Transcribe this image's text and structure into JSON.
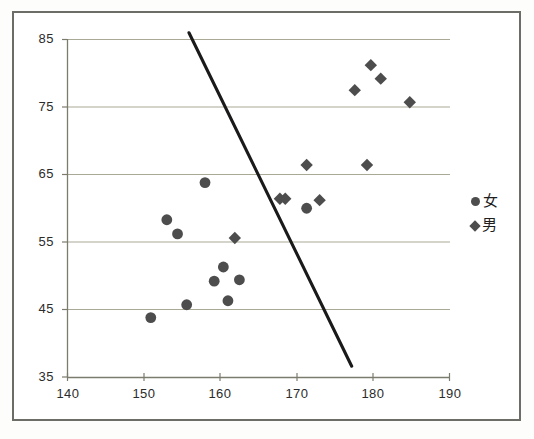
{
  "chart_data": {
    "type": "scatter",
    "title": "",
    "xlabel": "",
    "ylabel": "",
    "xlim": [
      140,
      190
    ],
    "ylim": [
      35,
      85
    ],
    "xticks": [
      140,
      150,
      160,
      170,
      180,
      190
    ],
    "yticks": [
      35,
      45,
      55,
      65,
      75,
      85
    ],
    "grid": "horizontal",
    "legend_position": "right",
    "marker_color": "#4d4d4d",
    "gridline_color": "#a9a995",
    "axis_color": "#8a8a7a",
    "trendline_color": "#1a1a1a",
    "series": [
      {
        "name": "女",
        "marker": "circle",
        "points": [
          [
            150.9,
            43.8
          ],
          [
            153.0,
            58.3
          ],
          [
            154.4,
            56.2
          ],
          [
            155.6,
            45.7
          ],
          [
            158.0,
            63.8
          ],
          [
            159.2,
            49.2
          ],
          [
            160.4,
            51.3
          ],
          [
            161.0,
            46.3
          ],
          [
            162.5,
            49.4
          ],
          [
            171.3,
            60.0
          ]
        ]
      },
      {
        "name": "男",
        "marker": "diamond",
        "points": [
          [
            161.9,
            55.6
          ],
          [
            167.8,
            61.4
          ],
          [
            168.5,
            61.4
          ],
          [
            171.3,
            66.4
          ],
          [
            173.0,
            61.2
          ],
          [
            177.6,
            77.5
          ],
          [
            179.2,
            66.4
          ],
          [
            179.7,
            81.2
          ],
          [
            181.0,
            79.2
          ],
          [
            184.8,
            75.7
          ]
        ]
      }
    ],
    "trendline": {
      "x0": 155.9,
      "y0": 86.0,
      "x1": 177.2,
      "y1": 36.6
    },
    "legend": [
      {
        "label": "女",
        "marker": "circle"
      },
      {
        "label": "男",
        "marker": "diamond"
      }
    ]
  }
}
